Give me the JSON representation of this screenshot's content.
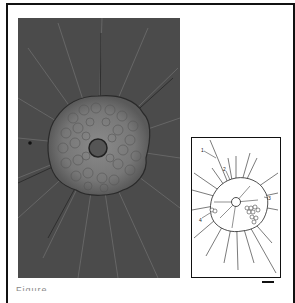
{
  "figure": {
    "panel_photo": {
      "description": "phase-contrast micrograph of radiating organism with central capsule",
      "background_color": "#4a4a4a"
    },
    "panel_drawing": {
      "description": "line drawing of organism with numbered structures",
      "labels": [
        "1",
        "2",
        "3",
        "4"
      ]
    },
    "scale_bar": "scale-bar",
    "caption_partial": "Figure ..."
  }
}
